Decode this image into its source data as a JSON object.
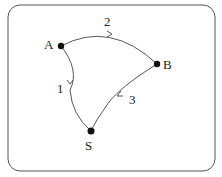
{
  "diagram": {
    "type": "directed-graph",
    "nodes": [
      {
        "id": "A",
        "label": "A"
      },
      {
        "id": "B",
        "label": "B"
      },
      {
        "id": "S",
        "label": "S"
      }
    ],
    "edges": [
      {
        "from": "A",
        "to": "S",
        "label": "1"
      },
      {
        "from": "A",
        "to": "B",
        "label": "2"
      },
      {
        "from": "B",
        "to": "S",
        "label": "3"
      }
    ]
  }
}
